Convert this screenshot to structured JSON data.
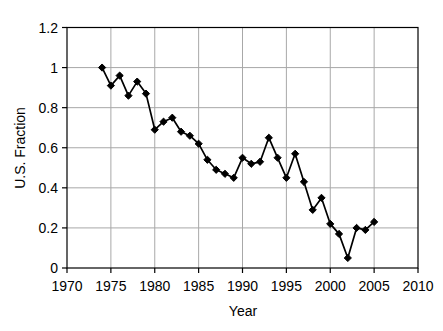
{
  "chart_data": {
    "type": "line",
    "title": "",
    "xlabel": "Year",
    "ylabel": "U.S. Fraction",
    "x": [
      1974,
      1975,
      1976,
      1977,
      1978,
      1979,
      1980,
      1981,
      1982,
      1983,
      1984,
      1985,
      1986,
      1987,
      1988,
      1989,
      1990,
      1991,
      1992,
      1993,
      1994,
      1995,
      1996,
      1997,
      1998,
      1999,
      2000,
      2001,
      2002,
      2003,
      2004,
      2005
    ],
    "values": [
      1.0,
      0.91,
      0.96,
      0.86,
      0.93,
      0.87,
      0.69,
      0.73,
      0.75,
      0.68,
      0.66,
      0.62,
      0.54,
      0.49,
      0.47,
      0.45,
      0.55,
      0.52,
      0.53,
      0.65,
      0.55,
      0.45,
      0.57,
      0.43,
      0.29,
      0.35,
      0.22,
      0.17,
      0.05,
      0.2,
      0.19,
      0.23
    ],
    "xlim": [
      1970,
      2010
    ],
    "ylim": [
      0,
      1.2
    ],
    "xticks": [
      1970,
      1975,
      1980,
      1985,
      1990,
      1995,
      2000,
      2005,
      2010
    ],
    "xtick_labels": [
      "1970",
      "1975",
      "1980",
      "1985",
      "1990",
      "1995",
      "2000",
      "2005",
      "2010"
    ],
    "yticks": [
      0,
      0.2,
      0.4,
      0.6,
      0.8,
      1,
      1.2
    ],
    "ytick_labels": [
      "0",
      "0.2",
      "0.4",
      "0.6",
      "0.8",
      "1",
      "1.2"
    ],
    "grid": true,
    "legend": "none",
    "marker": "diamond",
    "colors": {
      "series": "#000000",
      "marker_fill": "#000000",
      "grid": "#a8a8a8",
      "axis": "#000000",
      "background": "#ffffff"
    }
  }
}
